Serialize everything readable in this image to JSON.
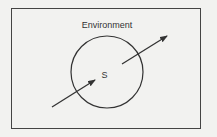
{
  "diagram": {
    "environment_label": "Environment",
    "system_label": "S",
    "colors": {
      "background": "#f2f2f0",
      "stroke": "#333333"
    },
    "arrows": [
      {
        "name": "input-arrow",
        "from": [
          52,
          107
        ],
        "to": [
          95,
          80
        ]
      },
      {
        "name": "output-arrow",
        "from": [
          122,
          64
        ],
        "to": [
          167,
          36
        ]
      }
    ]
  }
}
